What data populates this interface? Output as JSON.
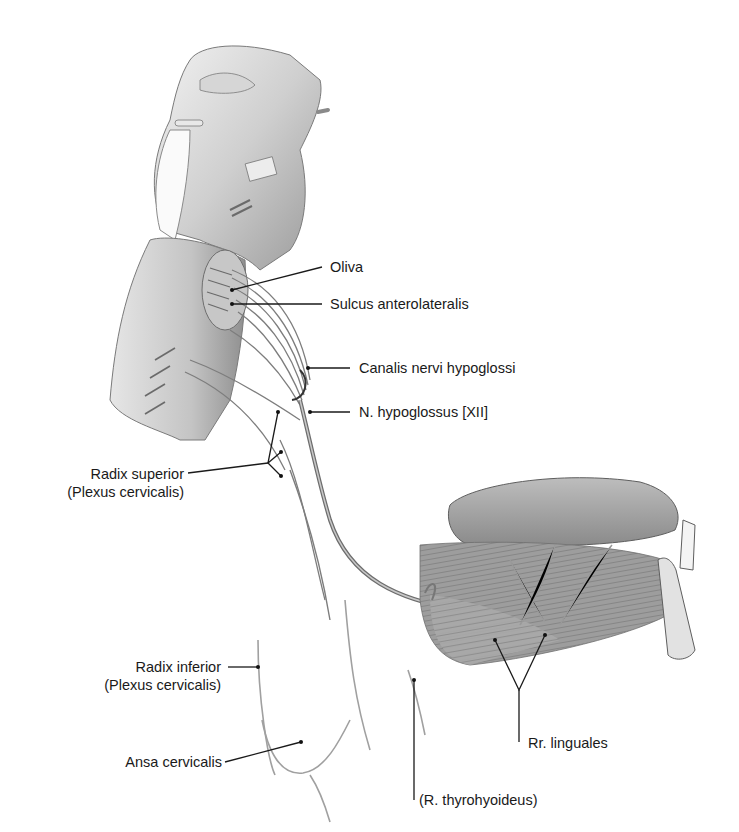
{
  "figure": {
    "labels": {
      "oliva": "Oliva",
      "sulcus": "Sulcus anterolateralis",
      "canalis": "Canalis nervi hypoglossi",
      "hypoglossus": "N. hypoglossus [XII]",
      "radix_superior_1": "Radix superior",
      "radix_superior_2": "(Plexus cervicalis)",
      "radix_inferior_1": "Radix inferior",
      "radix_inferior_2": "(Plexus cervicalis)",
      "ansa": "Ansa cervicalis",
      "thyrohyoideus": "(R. thyrohyoideus)",
      "linguales": "Rr. linguales"
    },
    "colors": {
      "background": "#ffffff",
      "leader": "#1a1a1a",
      "tissue_light": "#d9d9d9",
      "tissue_mid": "#a8a8a8",
      "tissue_dark": "#6e6e6e",
      "nerve": "#8c8c8c"
    }
  }
}
